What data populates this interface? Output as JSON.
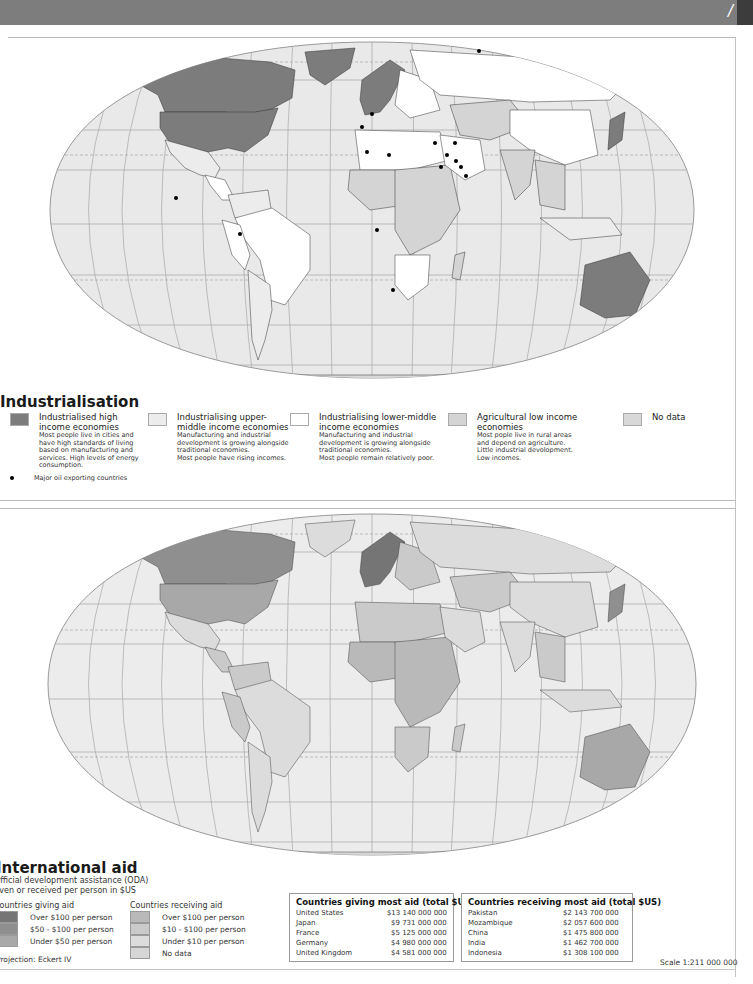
{
  "header": {
    "partial_glyph": "/"
  },
  "map1": {
    "title": "Industrialisation",
    "colors": {
      "ocean": "#e9e9e9",
      "grid": "#a8a8a8",
      "high_income": "#7c7c7c",
      "upper_middle": "#ececec",
      "lower_middle": "#ffffff",
      "agricultural": "#d4d4d4",
      "no_data": "#dadada",
      "border": "#333333"
    },
    "legend": [
      {
        "swatch": "#7c7c7c",
        "heading": "Industrialised high income economies",
        "desc": [
          "Most people live in cities and",
          "have high standards of living",
          "based on manufacturing and",
          "services. High levels of energy",
          "consumption."
        ]
      },
      {
        "swatch": "#ececec",
        "heading": "Industrialising upper-middle income economies",
        "desc": [
          "Manufacturing and industrial",
          "development is growing alongside",
          "traditional economies.",
          "Most people have rising incomes."
        ]
      },
      {
        "swatch": "#ffffff",
        "heading": "Industrialising lower-middle income economies",
        "desc": [
          "Manufacturing and industrial",
          "development is growing alongside",
          "traditional economies.",
          "Most people remain relatively poor."
        ]
      },
      {
        "swatch": "#d4d4d4",
        "heading": "Agricultural low income economies",
        "desc": [
          "Most pople live in rural areas",
          "and depend on agriculture.",
          "Little industrial devolopment.",
          "Low incomes."
        ]
      },
      {
        "swatch": "#d8d8d8",
        "heading": "No data",
        "desc": []
      }
    ],
    "oil_legend": "Major oil exporting countries",
    "oil_points": [
      [
        372,
        74
      ],
      [
        362,
        87
      ],
      [
        479,
        11
      ],
      [
        367,
        112
      ],
      [
        389,
        115
      ],
      [
        435,
        103
      ],
      [
        455,
        103
      ],
      [
        447,
        115
      ],
      [
        456,
        121
      ],
      [
        441,
        127
      ],
      [
        461,
        127
      ],
      [
        466,
        136
      ],
      [
        176,
        158
      ],
      [
        240,
        194
      ],
      [
        377,
        190
      ],
      [
        393,
        250
      ]
    ]
  },
  "map2": {
    "title": "International aid",
    "subtitle_lines": [
      "Official development assistance (ODA)",
      "given or received per person in $US"
    ],
    "giving": {
      "title": "Countries giving aid",
      "items": [
        {
          "label": "Over $100 per person",
          "color": "#757575"
        },
        {
          "label": "$50 - $100 per person",
          "color": "#8f8f8f"
        },
        {
          "label": "Under $50 per person",
          "color": "#a8a8a8"
        }
      ]
    },
    "receiving": {
      "title": "Countries receiving aid",
      "items": [
        {
          "label": "Over $100 per person",
          "color": "#b9b9b9"
        },
        {
          "label": "$10 - $100 per person",
          "color": "#cacaca"
        },
        {
          "label": "Under $10 per person",
          "color": "#dcdcdc"
        },
        {
          "label": "No data",
          "color": "#d6d6d6"
        }
      ]
    },
    "table_giving": {
      "title": "Countries giving most aid (total $US)",
      "rows": [
        {
          "country": "United States",
          "value": "$13 140 000 000"
        },
        {
          "country": "Japan",
          "value": "$9 731 000 000"
        },
        {
          "country": "France",
          "value": "$5 125 000 000"
        },
        {
          "country": "Germany",
          "value": "$4 980 000 000"
        },
        {
          "country": "United Kingdom",
          "value": "$4 581 000 000"
        }
      ]
    },
    "table_receiving": {
      "title": "Countries receiving most aid (total $US)",
      "rows": [
        {
          "country": "Pakistan",
          "value": "$2 143 700 000"
        },
        {
          "country": "Mozambique",
          "value": "$2 057 600 000"
        },
        {
          "country": "China",
          "value": "$1 475 800 000"
        },
        {
          "country": "India",
          "value": "$1 462 700 000"
        },
        {
          "country": "Indonesia",
          "value": "$1 308 100 000"
        }
      ]
    },
    "projection": "Projection: Eckert IV",
    "scale": "Scale 1:211 000 000"
  }
}
